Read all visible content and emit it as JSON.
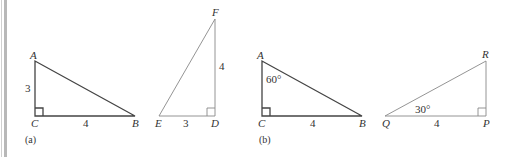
{
  "figure": {
    "part_a": {
      "caption": "(a)",
      "triangle_ABC": {
        "vertices": {
          "A": "A",
          "B": "B",
          "C": "C"
        },
        "side_AC": "3",
        "side_CB": "4",
        "right_angle_at": "C"
      },
      "triangle_EDF": {
        "vertices": {
          "E": "E",
          "D": "D",
          "F": "F"
        },
        "side_ED": "3",
        "side_DF": "4",
        "right_angle_at": "D"
      }
    },
    "part_b": {
      "caption": "(b)",
      "triangle_ABC": {
        "vertices": {
          "A": "A",
          "B": "B",
          "C": "C"
        },
        "angle_A": "60°",
        "side_CB": "4",
        "right_angle_at": "C"
      },
      "triangle_QPR": {
        "vertices": {
          "Q": "Q",
          "P": "P",
          "R": "R"
        },
        "angle_Q": "30°",
        "side_QP": "4",
        "right_angle_at": "P"
      }
    }
  }
}
